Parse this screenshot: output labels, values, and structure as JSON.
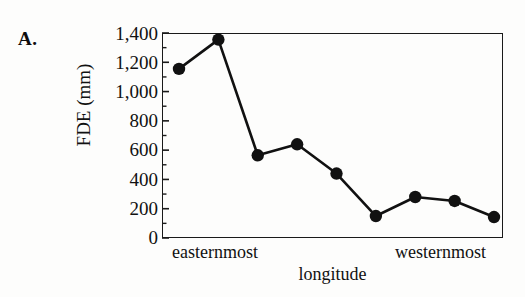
{
  "figure": {
    "panel_label": "A."
  },
  "chart_data": {
    "type": "line",
    "title": "",
    "xlabel": "longitude",
    "ylabel": "FDE (mm)",
    "ylim": [
      0,
      1400
    ],
    "ytick_labels": [
      "1,400",
      "1,200",
      "1,000",
      "800",
      "600",
      "400",
      "200",
      "0"
    ],
    "ytick_values": [
      1400,
      1200,
      1000,
      800,
      600,
      400,
      200,
      0
    ],
    "minor_ticks": true,
    "grid": false,
    "legend": null,
    "x_category_labels": [
      "easternmost",
      "westernmost"
    ],
    "x": [
      1,
      2,
      3,
      4,
      5,
      6,
      7,
      8,
      9
    ],
    "values": [
      1155,
      1355,
      565,
      640,
      440,
      150,
      280,
      253,
      143
    ],
    "marker": "filled-circle",
    "marker_color": "#111111",
    "line_color": "#111111"
  }
}
